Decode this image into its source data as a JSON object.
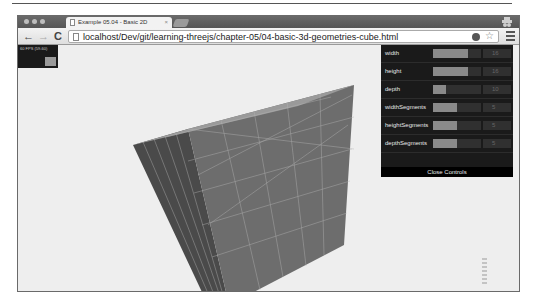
{
  "browser": {
    "tab_title": "Example 05.04 - Basic 2D",
    "tab_close": "×",
    "nav": {
      "back": "←",
      "forward": "→",
      "reload": "C"
    },
    "url": "localhost/Dev/git/learning-threejs/chapter-05/04-basic-3d-geometries-cube.html"
  },
  "stats": {
    "fps_text": "60 FPS (59-60)"
  },
  "controls": {
    "rows": [
      {
        "label": "width",
        "value": "16",
        "fill_pct": 72
      },
      {
        "label": "height",
        "value": "16",
        "fill_pct": 72
      },
      {
        "label": "depth",
        "value": "10",
        "fill_pct": 28
      },
      {
        "label": "widthSegments",
        "value": "5",
        "fill_pct": 50
      },
      {
        "label": "heightSegments",
        "value": "5",
        "fill_pct": 50
      },
      {
        "label": "depthSegments",
        "value": "5",
        "fill_pct": 50
      }
    ],
    "close_label": "Close Controls"
  },
  "colors": {
    "gui_bg": "#1a1a1a",
    "slider_fill": "#8a8a8a",
    "viewport_bg": "#eeeeee",
    "cube_front": "#6d6d6d",
    "cube_side": "#4a4a4a",
    "cube_top": "#9a9a9a"
  }
}
